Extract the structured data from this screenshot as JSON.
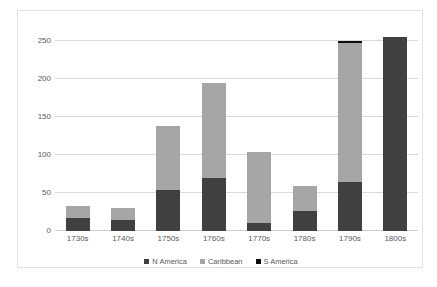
{
  "chart_data": {
    "type": "bar",
    "subtype": "stacked-bar",
    "title": "",
    "subtitle": "",
    "xlabel": "",
    "ylabel": "",
    "categories": [
      "1730s",
      "1740s",
      "1750s",
      "1760s",
      "1770s",
      "1780s",
      "1790s",
      "1800s"
    ],
    "series": [
      {
        "name": "N America",
        "color": "#404040",
        "values": [
          17,
          15,
          54,
          70,
          11,
          27,
          65,
          255
        ]
      },
      {
        "name": "Caribbean",
        "color": "#a6a6a6",
        "values": [
          16,
          15,
          84,
          125,
          93,
          32,
          182,
          0
        ]
      },
      {
        "name": "S America",
        "color": "#0d0d0d",
        "values": [
          0,
          0,
          0,
          0,
          0,
          0,
          3,
          0
        ]
      }
    ],
    "totals": [
      33,
      30,
      138,
      195,
      104,
      59,
      250,
      255
    ],
    "ylim": [
      0,
      262
    ],
    "yticks": [
      0,
      50,
      100,
      150,
      200,
      250
    ],
    "ytick_labels": [
      "0",
      "50",
      "100",
      "150",
      "200",
      "250"
    ],
    "grid": true,
    "grid_axis": "y",
    "legend_position": "bottom",
    "plot_background": "#ffffff",
    "grid_color": "#d9d9d9",
    "text_color": "#595959",
    "border_color": "#e2e2e2"
  },
  "legend": {
    "items": [
      {
        "label": "N America",
        "color": "#404040"
      },
      {
        "label": "Caribbean",
        "color": "#a6a6a6"
      },
      {
        "label": "S America",
        "color": "#0d0d0d"
      }
    ]
  }
}
